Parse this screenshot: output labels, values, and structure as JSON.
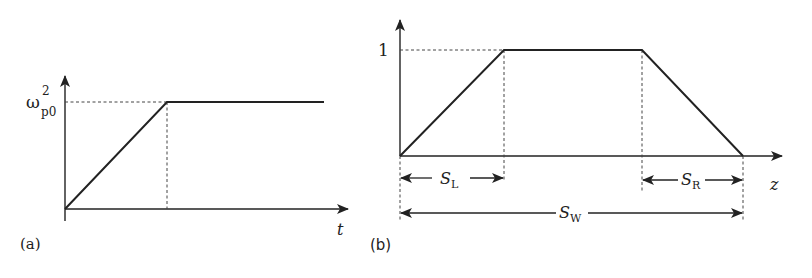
{
  "figure": {
    "panel_a": {
      "label": "(a)",
      "y_level_symbol": "ω",
      "y_level_superscript": "2",
      "y_level_subscript": "p0",
      "x_axis_label": "t",
      "description": "Linear ramp from zero up to ω²p0, then constant plateau"
    },
    "panel_b": {
      "label": "(b)",
      "y_level_value": "1",
      "x_axis_label": "z",
      "description": "Trapezoidal profile: linear rise over S_L, plateau at 1, linear fall over S_R; total width S_W",
      "dimensions": [
        {
          "symbol": "S",
          "subscript": "L",
          "meaning": "left ramp length"
        },
        {
          "symbol": "S",
          "subscript": "R",
          "meaning": "right ramp length"
        },
        {
          "symbol": "S",
          "subscript": "W",
          "meaning": "total width"
        }
      ]
    },
    "colors": {
      "line": "#222222",
      "dashed": "#444444",
      "background": "#ffffff"
    }
  }
}
